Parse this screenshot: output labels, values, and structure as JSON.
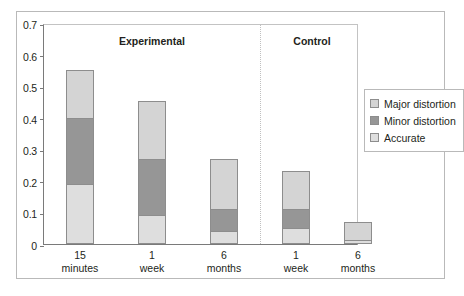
{
  "chart_data": {
    "type": "bar",
    "subtype": "stacked-bar-grouped",
    "title": "",
    "xlabel": "",
    "ylabel": "",
    "ylim": [
      0,
      0.7
    ],
    "yticks": [
      "0",
      "0.1",
      "0.2",
      "0.3",
      "0.4",
      "0.5",
      "0.6",
      "0.7"
    ],
    "ytick_values": [
      0,
      0.1,
      0.2,
      0.3,
      0.4,
      0.5,
      0.6,
      0.7
    ],
    "grid": false,
    "legend_position": "right",
    "groups": [
      {
        "name": "Experimental",
        "label": "Experimental"
      },
      {
        "name": "Control",
        "label": "Control"
      }
    ],
    "categories": [
      {
        "line1": "15",
        "line2": "minutes",
        "group": "Experimental"
      },
      {
        "line1": "1",
        "line2": "week",
        "group": "Experimental"
      },
      {
        "line1": "6",
        "line2": "months",
        "group": "Experimental"
      },
      {
        "line1": "1",
        "line2": "week",
        "group": "Control"
      },
      {
        "line1": "6",
        "line2": "months",
        "group": "Control"
      }
    ],
    "series": [
      {
        "name": "Accurate",
        "color": "#dedede",
        "values": [
          0.19,
          0.093,
          0.042,
          0.05,
          0.012
        ]
      },
      {
        "name": "Minor distortion",
        "color": "#969696",
        "values": [
          0.21,
          0.175,
          0.069,
          0.061,
          0.0
        ]
      },
      {
        "name": "Major distortion",
        "color": "#d4d4d4",
        "values": [
          0.15,
          0.184,
          0.157,
          0.12,
          0.058
        ]
      }
    ],
    "totals": [
      0.55,
      0.452,
      0.268,
      0.231,
      0.07
    ],
    "legend": [
      {
        "label": "Major distortion",
        "color": "#d4d4d4"
      },
      {
        "label": "Minor distortion",
        "color": "#969696"
      },
      {
        "label": "Accurate",
        "color": "#dedede"
      }
    ],
    "colors": {
      "major_distortion": "#d4d4d4",
      "minor_distortion": "#969696",
      "accurate": "#dedede",
      "axis": "#7a7a7a",
      "frame": "#b9b9b9",
      "text": "#231f20"
    }
  }
}
